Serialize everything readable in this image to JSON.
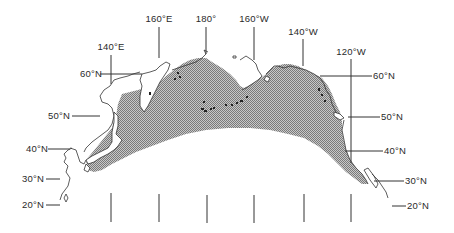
{
  "map": {
    "title": "",
    "shaded_region": "North Pacific distribution range (stippled)",
    "fill_color": "#9a9a9a",
    "line_color": "#333333",
    "longitude_labels": [
      {
        "label": "140°E",
        "x": 111,
        "label_y": 50,
        "line_top": 55,
        "line_bottom": 84
      },
      {
        "label": "160°E",
        "x": 159,
        "label_y": 22,
        "line_top": 27,
        "line_bottom": 58
      },
      {
        "label": "180°",
        "x": 206,
        "label_y": 22,
        "line_top": 27,
        "line_bottom": 54
      },
      {
        "label": "160°W",
        "x": 254,
        "label_y": 22,
        "line_top": 27,
        "line_bottom": 60
      },
      {
        "label": "140°W",
        "x": 303,
        "label_y": 35,
        "line_top": 39,
        "line_bottom": 66
      },
      {
        "label": "120°W",
        "x": 351,
        "label_y": 55,
        "line_top": 59,
        "line_bottom": 163
      }
    ],
    "latitude_labels_left": [
      {
        "label": "60°N",
        "label_x": 80,
        "y": 74,
        "line_x1": 100,
        "line_x2": 142
      },
      {
        "label": "50°N",
        "label_x": 48,
        "y": 116,
        "line_x1": 72,
        "line_x2": 100
      },
      {
        "label": "40°N",
        "label_x": 26,
        "y": 149,
        "line_x1": 48,
        "line_x2": 70
      },
      {
        "label": "30°N",
        "label_x": 22,
        "y": 179,
        "line_x1": 46,
        "line_x2": 60
      },
      {
        "label": "20°N",
        "label_x": 22,
        "y": 205,
        "line_x1": 46,
        "line_x2": 60
      }
    ],
    "latitude_labels_right": [
      {
        "label": "60°N",
        "label_x": 373,
        "y": 76,
        "line_x1": 320,
        "line_x2": 372
      },
      {
        "label": "50°N",
        "label_x": 381,
        "y": 117,
        "line_x1": 348,
        "line_x2": 380
      },
      {
        "label": "40°N",
        "label_x": 384,
        "y": 151,
        "line_x1": 345,
        "line_x2": 383
      },
      {
        "label": "30°N",
        "label_x": 405,
        "y": 181,
        "line_x1": 374,
        "line_x2": 404
      },
      {
        "label": "20°N",
        "label_x": 407,
        "y": 206,
        "line_x1": 392,
        "line_x2": 406
      }
    ],
    "bottom_ticks_x": [
      111,
      159,
      207,
      254,
      304,
      351
    ]
  }
}
